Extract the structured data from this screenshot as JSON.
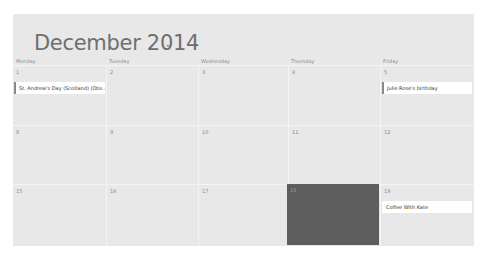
{
  "header": {
    "title": "December 2014",
    "chevron": "⌄"
  },
  "weekdays": [
    "Monday",
    "Tuesday",
    "Wednesday",
    "Thursday",
    "Friday"
  ],
  "weeks": [
    {
      "days": [
        {
          "num": "1",
          "event": "St. Andrew's Day (Scotland) (Obs..."
        },
        {
          "num": "2"
        },
        {
          "num": "3"
        },
        {
          "num": "4"
        },
        {
          "num": "5",
          "event": "Julie Rose's birthday"
        }
      ]
    },
    {
      "days": [
        {
          "num": "8"
        },
        {
          "num": "9"
        },
        {
          "num": "10"
        },
        {
          "num": "11"
        },
        {
          "num": "12"
        }
      ]
    },
    {
      "days": [
        {
          "num": "15"
        },
        {
          "num": "16"
        },
        {
          "num": "17"
        },
        {
          "num": "18",
          "today": true
        },
        {
          "num": "19",
          "event": "Coffee With Kate"
        }
      ]
    }
  ],
  "colors": {
    "panel": "#e8e8e8",
    "today": "#5e5e5e",
    "event_bg": "#ffffff",
    "event_accent": "#8a8a8a"
  }
}
